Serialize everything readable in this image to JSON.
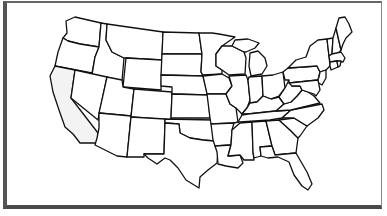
{
  "map": {
    "title": "",
    "type": "us-states-outline",
    "highlighted_state": "California",
    "highlight_color": "#f3f3f3",
    "stroke_color": "#111111",
    "background_color": "#ffffff",
    "frame_color": "#555555"
  }
}
